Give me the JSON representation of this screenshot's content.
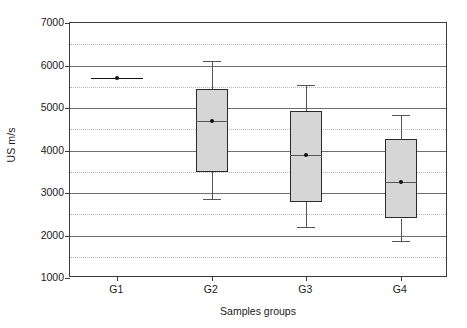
{
  "chart_data": {
    "type": "box",
    "title": "",
    "xlabel": "Samples groups",
    "ylabel": "US m/s",
    "categories": [
      "G1",
      "G2",
      "G3",
      "G4"
    ],
    "ylim": [
      1000,
      7000
    ],
    "ytick_labels": [
      "1000",
      "2000",
      "3000",
      "4000",
      "5000",
      "6000",
      "7000"
    ],
    "ytick_values": [
      1000,
      2000,
      3000,
      4000,
      5000,
      6000,
      7000
    ],
    "minor_gridline_values": [
      1500,
      2500,
      3500,
      4500,
      5500,
      6500
    ],
    "grid": "major solid, minor dotted",
    "legend": "none",
    "boxes": [
      {
        "category": "G1",
        "whisker_low": 5700,
        "q1": 5700,
        "median": 5700,
        "q3": 5700,
        "whisker_high": 5700,
        "mean": 5700,
        "degenerate": true,
        "note": "all values identical - rendered as a single horizontal line"
      },
      {
        "category": "G2",
        "whisker_low": 2850,
        "q1": 3500,
        "median": 4700,
        "q3": 5450,
        "whisker_high": 6100,
        "mean": 4700,
        "degenerate": false
      },
      {
        "category": "G3",
        "whisker_low": 2200,
        "q1": 2780,
        "median": 3900,
        "q3": 4930,
        "whisker_high": 5540,
        "mean": 3900,
        "degenerate": false
      },
      {
        "category": "G4",
        "whisker_low": 1870,
        "q1": 2400,
        "median": 3270,
        "q3": 4280,
        "whisker_high": 4830,
        "mean": 3270,
        "degenerate": false
      }
    ],
    "colors": {
      "box_fill": "#d6d6d6",
      "box_edge": "#2b2b2b",
      "whisker": "#555555",
      "major_grid": "#6e6e6e",
      "minor_grid": "#b9b9b9",
      "frame": "#3a3a3a",
      "text": "#1a1a1a"
    }
  }
}
